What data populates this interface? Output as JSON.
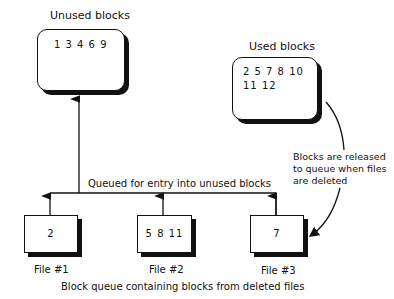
{
  "unused": {
    "title": "Unused blocks",
    "values": "1 3 4 6 9"
  },
  "used": {
    "title": "Used blocks",
    "line1": "2 5 7 8 10",
    "line2": "11 12"
  },
  "annotation": {
    "line1": "Blocks are released",
    "line2": "to queue when files",
    "line3": "are deleted"
  },
  "queue_label": "Queued for entry into unused blocks",
  "files": [
    {
      "label": "File #1",
      "values": "2"
    },
    {
      "label": "File #2",
      "values": "5 8 11"
    },
    {
      "label": "File #3",
      "values": "7"
    }
  ],
  "caption": "Block queue containing blocks from deleted files"
}
